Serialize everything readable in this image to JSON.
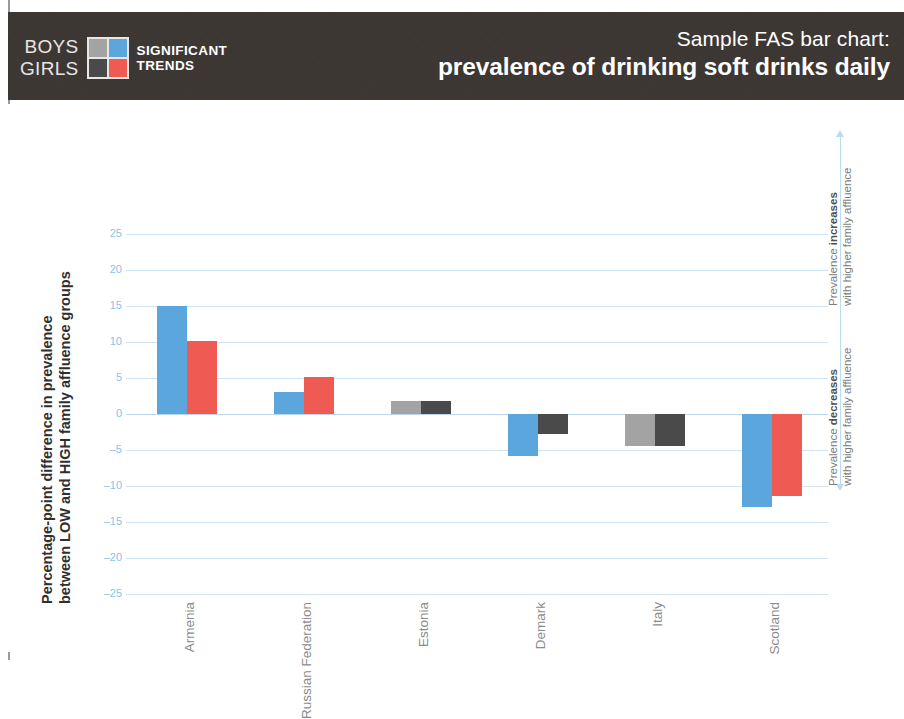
{
  "header": {
    "legend": {
      "row1_label": "BOYS",
      "row2_label": "GIRLS",
      "caption_line1": "SIGNIFICANT",
      "caption_line2": "TRENDS",
      "swatch": {
        "top_left": "#a3a3a3",
        "top_right": "#5ba7dd",
        "bottom_left": "#4a4a4a",
        "bottom_right": "#ef5b52"
      }
    },
    "title_line1": "Sample FAS bar chart:",
    "title_line2": "prevalence of drinking soft drinks daily",
    "background_color": "#3d3734"
  },
  "annotations": {
    "upper": {
      "line1_prefix": "Prevalence ",
      "line1_bold": "increases",
      "line2": "with higher family affluence",
      "arrow": "arrow-up-icon"
    },
    "lower": {
      "line1_prefix": "Prevalence ",
      "line1_bold": "decreases",
      "line2": "with higher family affluence",
      "arrow": "arrow-down-icon"
    }
  },
  "chart_data": {
    "type": "bar",
    "title": "Sample FAS bar chart: prevalence of drinking soft drinks daily",
    "xlabel": "",
    "ylabel": "Percentage-point difference in prevalence between LOW and HIGH family affluence groups",
    "ylabel_line1": "Percentage-point difference in prevalence",
    "ylabel_line2": "between LOW and HIGH family affluence groups",
    "ylim": [
      -25,
      25
    ],
    "ytick_values": [
      25,
      20,
      15,
      10,
      5,
      0,
      -5,
      -10,
      -15,
      -20,
      -25
    ],
    "ytick_labels": [
      "25",
      "20",
      "15",
      "10",
      "5",
      "0",
      "–5",
      "–10",
      "–15",
      "–20",
      "–25"
    ],
    "grid": true,
    "legend_position": "header",
    "categories": [
      "Armenia",
      "Russian Federation",
      "Estonia",
      "Demark",
      "Italy",
      "Scotland"
    ],
    "series": [
      {
        "name": "Boys",
        "values": [
          15.0,
          3.1,
          1.8,
          -5.9,
          -4.4,
          -12.9
        ],
        "significant": [
          true,
          true,
          false,
          true,
          false,
          true
        ],
        "colors": [
          "#5ba7dd",
          "#5ba7dd",
          "#a3a3a3",
          "#5ba7dd",
          "#a3a3a3",
          "#5ba7dd"
        ]
      },
      {
        "name": "Girls",
        "values": [
          10.2,
          5.1,
          1.8,
          -2.8,
          -4.4,
          -11.4
        ],
        "significant": [
          true,
          true,
          false,
          false,
          false,
          true
        ],
        "colors": [
          "#ef5b52",
          "#ef5b52",
          "#4a4a4a",
          "#4a4a4a",
          "#4a4a4a",
          "#ef5b52"
        ]
      }
    ],
    "colors": {
      "boys_significant": "#5ba7dd",
      "girls_significant": "#ef5b52",
      "boys_nonsignificant": "#a3a3a3",
      "girls_nonsignificant": "#4a4a4a",
      "gridline": "#cfe3f2",
      "tick_label": "#8cc3e6",
      "category_label": "#8b8b8b"
    }
  }
}
